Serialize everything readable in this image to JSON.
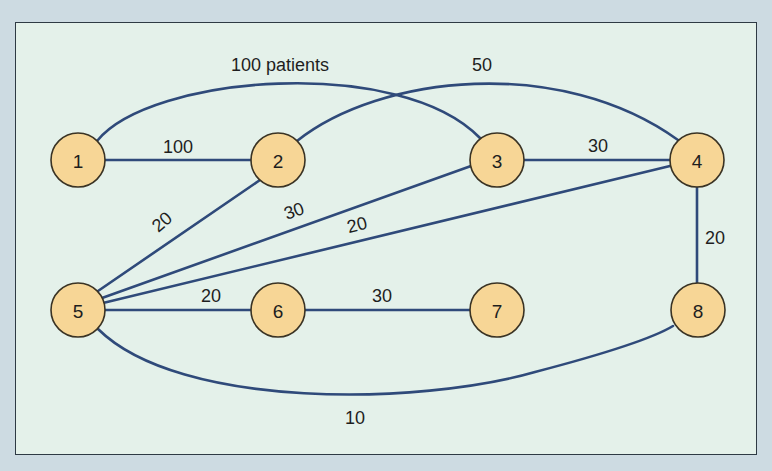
{
  "diagram": {
    "type": "network-graph",
    "colors": {
      "outer_background": "#cddbe2",
      "panel_background": "#e4f1ea",
      "node_fill": "#f7d696",
      "node_stroke": "#3a3324",
      "edge_color": "#2f4a7a"
    },
    "nodes": [
      {
        "id": "1",
        "label": "1",
        "x": 78,
        "y": 160
      },
      {
        "id": "2",
        "label": "2",
        "x": 278,
        "y": 160
      },
      {
        "id": "3",
        "label": "3",
        "x": 497,
        "y": 160
      },
      {
        "id": "4",
        "label": "4",
        "x": 697,
        "y": 160
      },
      {
        "id": "5",
        "label": "5",
        "x": 78,
        "y": 310
      },
      {
        "id": "6",
        "label": "6",
        "x": 278,
        "y": 310
      },
      {
        "id": "7",
        "label": "7",
        "x": 497,
        "y": 310
      },
      {
        "id": "8",
        "label": "8",
        "x": 698,
        "y": 310
      }
    ],
    "edges": [
      {
        "from": "1",
        "to": "2",
        "label": "100",
        "shape": "straight"
      },
      {
        "from": "1",
        "to": "3",
        "label": "100 patients",
        "shape": "arc-up"
      },
      {
        "from": "2",
        "to": "4",
        "label": "50",
        "shape": "arc-up"
      },
      {
        "from": "3",
        "to": "4",
        "label": "30",
        "shape": "straight"
      },
      {
        "from": "5",
        "to": "2",
        "label": "20",
        "shape": "straight"
      },
      {
        "from": "5",
        "to": "3",
        "label": "30",
        "shape": "straight"
      },
      {
        "from": "5",
        "to": "4",
        "label": "20",
        "shape": "straight"
      },
      {
        "from": "5",
        "to": "6",
        "label": "20",
        "shape": "straight"
      },
      {
        "from": "6",
        "to": "7",
        "label": "30",
        "shape": "straight"
      },
      {
        "from": "4",
        "to": "8",
        "label": "20",
        "shape": "straight"
      },
      {
        "from": "5",
        "to": "8",
        "label": "10",
        "shape": "arc-down"
      }
    ]
  }
}
